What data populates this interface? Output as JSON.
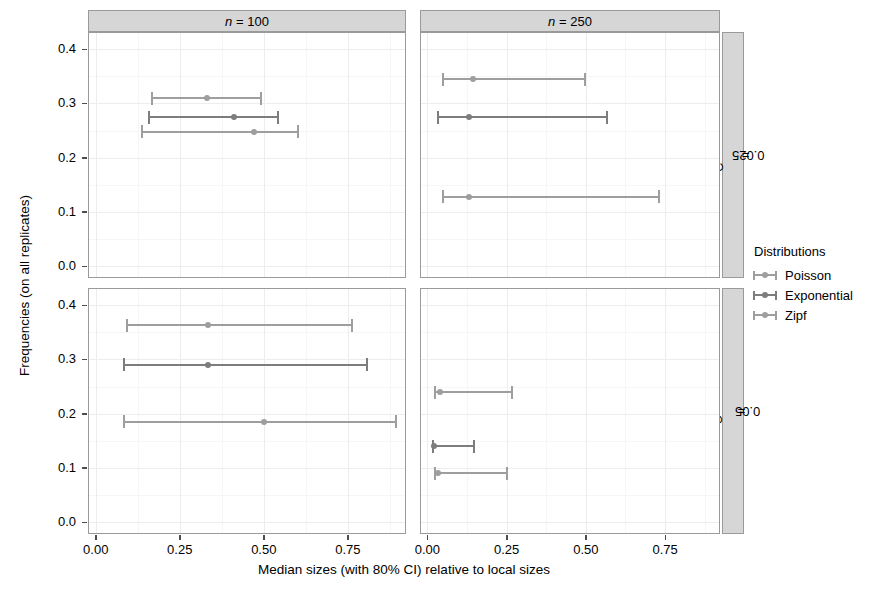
{
  "chart_data": {
    "type": "scatter",
    "title": "",
    "xlabel": "Median sizes (with 80% CI) relative to local sizes",
    "ylabel": "Frequencies (on all replicates)",
    "xlim": [
      -0.02,
      0.92
    ],
    "ylim": [
      -0.02,
      0.43
    ],
    "x_ticks": [
      "0.00",
      "0.25",
      "0.50",
      "0.75"
    ],
    "x_tick_values": [
      0.0,
      0.25,
      0.5,
      0.75
    ],
    "y_ticks": [
      "0.0",
      "0.1",
      "0.2",
      "0.3",
      "0.4"
    ],
    "y_tick_values": [
      0.0,
      0.1,
      0.2,
      0.3,
      0.4
    ],
    "grid": true,
    "legend_title": "Distributions",
    "legend_position": "right",
    "series_names": [
      "Poisson",
      "Exponential",
      "Zipf"
    ],
    "series_colors": [
      "#9a9a9a",
      "#7a7a7a",
      "#9a9a9a"
    ],
    "facet_cols": [
      "n = 100",
      "n = 250"
    ],
    "facet_rows": [
      "C = 0.025",
      "C = 0.05"
    ],
    "panels": [
      {
        "col_label": "n = 100",
        "row_label": "C = 0.025",
        "points": [
          {
            "series": "Poisson",
            "y": 0.31,
            "median": 0.33,
            "lo": 0.165,
            "hi": 0.495
          },
          {
            "series": "Exponential",
            "y": 0.275,
            "median": 0.41,
            "lo": 0.155,
            "hi": 0.545
          },
          {
            "series": "Zipf",
            "y": 0.248,
            "median": 0.47,
            "lo": 0.135,
            "hi": 0.605
          }
        ]
      },
      {
        "col_label": "n = 250",
        "row_label": "C = 0.025",
        "points": [
          {
            "series": "Poisson",
            "y": 0.345,
            "median": 0.145,
            "lo": 0.045,
            "hi": 0.5
          },
          {
            "series": "Exponential",
            "y": 0.275,
            "median": 0.13,
            "lo": 0.03,
            "hi": 0.57
          },
          {
            "series": "Zipf",
            "y": 0.128,
            "median": 0.13,
            "lo": 0.045,
            "hi": 0.735
          }
        ]
      },
      {
        "col_label": "n = 100",
        "row_label": "C = 0.05",
        "points": [
          {
            "series": "Poisson",
            "y": 0.363,
            "median": 0.335,
            "lo": 0.09,
            "hi": 0.765
          },
          {
            "series": "Exponential",
            "y": 0.29,
            "median": 0.335,
            "lo": 0.08,
            "hi": 0.81
          },
          {
            "series": "Zipf",
            "y": 0.185,
            "median": 0.5,
            "lo": 0.08,
            "hi": 0.895
          }
        ]
      },
      {
        "col_label": "n = 250",
        "row_label": "C = 0.05",
        "points": [
          {
            "series": "Poisson",
            "y": 0.24,
            "median": 0.04,
            "lo": 0.02,
            "hi": 0.27
          },
          {
            "series": "Exponential",
            "y": 0.14,
            "median": 0.02,
            "lo": 0.015,
            "hi": 0.15
          },
          {
            "series": "Zipf",
            "y": 0.09,
            "median": 0.035,
            "lo": 0.02,
            "hi": 0.255
          }
        ]
      }
    ]
  },
  "axes": {
    "y_title": "Frequencies (on all replicates)",
    "x_title": "Median sizes (with 80% CI) relative to local sizes"
  },
  "strips": {
    "col": [
      {
        "var": "n",
        "eq": " = ",
        "val": "100"
      },
      {
        "var": "n",
        "eq": " = ",
        "val": "250"
      }
    ],
    "row": [
      {
        "var": "C",
        "eq": " = ",
        "val": "0.025"
      },
      {
        "var": "C",
        "eq": " = ",
        "val": "0.05"
      }
    ]
  },
  "legend": {
    "title": "Distributions",
    "items": [
      {
        "label": "Poisson",
        "color": "#9e9e9e"
      },
      {
        "label": "Exponential",
        "color": "#7d7d7d"
      },
      {
        "label": "Zipf",
        "color": "#9e9e9e"
      }
    ]
  },
  "colors": {
    "panel_border": "#9a9a9a",
    "strip_fill": "#d6d6d6",
    "grid_major": "#ededed",
    "grid_minor": "#f7f7f7",
    "text": "#000000"
  }
}
